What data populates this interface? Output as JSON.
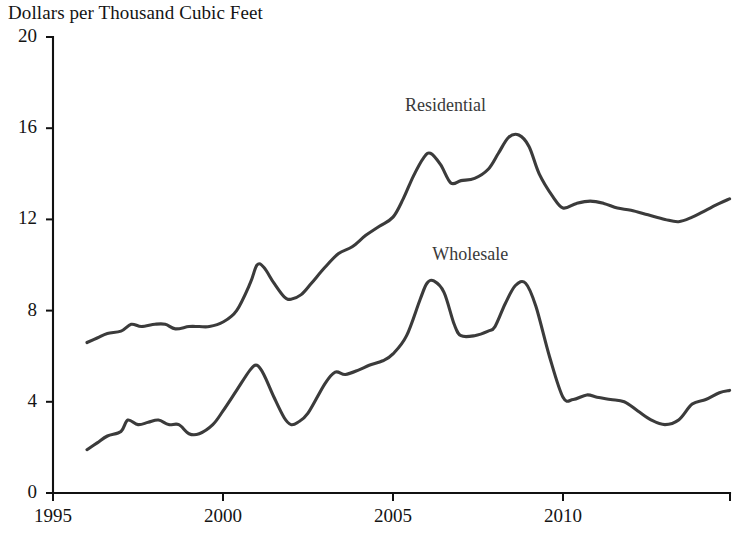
{
  "chart_data": {
    "type": "line",
    "title": "Dollars per Thousand Cubic Feet",
    "xlabel": "",
    "ylabel": "Dollars per Thousand Cubic Feet",
    "xlim": [
      1995,
      2014.9
    ],
    "ylim": [
      0,
      20
    ],
    "grid": false,
    "legend_position": "inline-annotation",
    "xticks": [
      1995,
      2000,
      2005,
      2010
    ],
    "xtick_labels": [
      "1995",
      "2000",
      "2005",
      "2010"
    ],
    "yticks": [
      0,
      4,
      8,
      12,
      16,
      20
    ],
    "ytick_labels": [
      "0",
      "4",
      "8",
      "12",
      "16",
      "20"
    ],
    "annotations": [
      {
        "text": "Residential",
        "x": 2007.0,
        "y": 17.0
      },
      {
        "text": "Wholesale",
        "x": 2007.8,
        "y": 10.5
      }
    ],
    "series": [
      {
        "name": "Residential",
        "x": [
          1996.0,
          1996.3,
          1996.6,
          1997.0,
          1997.3,
          1997.6,
          1998.0,
          1998.3,
          1998.6,
          1999.0,
          1999.3,
          1999.6,
          2000.0,
          2000.4,
          2000.8,
          2001.0,
          2001.2,
          2001.5,
          2001.8,
          2002.0,
          2002.3,
          2002.6,
          2003.0,
          2003.4,
          2003.8,
          2004.2,
          2004.6,
          2005.0,
          2005.3,
          2005.6,
          2005.9,
          2006.1,
          2006.4,
          2006.7,
          2007.0,
          2007.4,
          2007.8,
          2008.1,
          2008.4,
          2008.7,
          2009.0,
          2009.3,
          2009.7,
          2010.0,
          2010.4,
          2010.8,
          2011.2,
          2011.6,
          2012.0,
          2012.5,
          2013.0,
          2013.4,
          2013.8,
          2014.2,
          2014.6,
          2014.9
        ],
        "y": [
          6.6,
          6.8,
          7.0,
          7.1,
          7.4,
          7.3,
          7.4,
          7.4,
          7.2,
          7.3,
          7.3,
          7.3,
          7.5,
          8.0,
          9.2,
          10.0,
          9.9,
          9.2,
          8.6,
          8.5,
          8.7,
          9.2,
          9.9,
          10.5,
          10.8,
          11.3,
          11.7,
          12.1,
          12.9,
          13.9,
          14.7,
          14.9,
          14.4,
          13.6,
          13.7,
          13.8,
          14.2,
          14.9,
          15.6,
          15.7,
          15.2,
          14.0,
          13.0,
          12.5,
          12.7,
          12.8,
          12.7,
          12.5,
          12.4,
          12.2,
          12.0,
          11.9,
          12.1,
          12.4,
          12.7,
          12.9
        ],
        "color": "#3b3b3b"
      },
      {
        "name": "Wholesale",
        "x": [
          1996.0,
          1996.3,
          1996.6,
          1997.0,
          1997.2,
          1997.5,
          1997.8,
          1998.1,
          1998.4,
          1998.7,
          1999.0,
          1999.3,
          1999.7,
          2000.0,
          2000.4,
          2000.8,
          2001.0,
          2001.2,
          2001.5,
          2001.8,
          2002.0,
          2002.2,
          2002.5,
          2003.0,
          2003.3,
          2003.6,
          2004.0,
          2004.3,
          2004.7,
          2005.0,
          2005.4,
          2005.8,
          2006.0,
          2006.2,
          2006.5,
          2006.8,
          2007.0,
          2007.4,
          2007.8,
          2008.0,
          2008.3,
          2008.6,
          2008.9,
          2009.2,
          2009.6,
          2010.0,
          2010.3,
          2010.7,
          2011.0,
          2011.4,
          2011.8,
          2012.2,
          2012.6,
          2013.0,
          2013.4,
          2013.8,
          2014.2,
          2014.6,
          2014.9
        ],
        "y": [
          1.9,
          2.2,
          2.5,
          2.7,
          3.2,
          3.0,
          3.1,
          3.2,
          3.0,
          3.0,
          2.6,
          2.6,
          3.0,
          3.6,
          4.5,
          5.4,
          5.6,
          5.2,
          4.2,
          3.3,
          3.0,
          3.1,
          3.5,
          4.8,
          5.3,
          5.2,
          5.4,
          5.6,
          5.8,
          6.1,
          6.9,
          8.5,
          9.2,
          9.3,
          8.8,
          7.4,
          6.9,
          6.9,
          7.1,
          7.3,
          8.3,
          9.1,
          9.2,
          8.2,
          6.0,
          4.2,
          4.1,
          4.3,
          4.2,
          4.1,
          4.0,
          3.6,
          3.2,
          3.0,
          3.2,
          3.9,
          4.1,
          4.4,
          4.5
        ],
        "color": "#3b3b3b"
      }
    ]
  },
  "plot_geometry": {
    "x0_px": 53,
    "y0_px": 493,
    "x_per_year_px": 34.0,
    "y_per_unit_px": 22.8,
    "x_axis_end_px": 730,
    "y_axis_top_px": 37
  }
}
